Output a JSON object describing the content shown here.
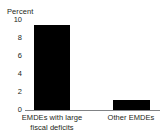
{
  "chart_data": {
    "type": "bar",
    "title": "",
    "ylabel": "Percent",
    "xlabel": "",
    "categories": [
      "EMDEs with large fiscal deficits",
      "Other EMDEs"
    ],
    "category_lines": [
      [
        "EMDEs with large",
        "fiscal deficits"
      ],
      [
        "Other EMDEs"
      ]
    ],
    "values": [
      9.4,
      1.1
    ],
    "ylim": [
      0,
      10
    ],
    "yticks": [
      0,
      2,
      4,
      6,
      8,
      10
    ],
    "ytick_labels": [
      "0",
      "2",
      "4",
      "6",
      "8",
      "10"
    ],
    "grid": false,
    "legend": false,
    "bar_color": "#000000",
    "axis_color": "#808285",
    "text_color": "#231f20"
  }
}
